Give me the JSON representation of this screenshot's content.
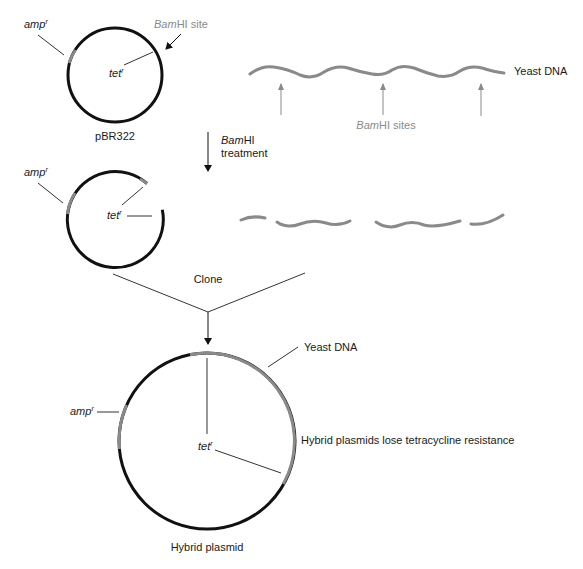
{
  "diagram": {
    "colors": {
      "plasmid_dna": "#111111",
      "yeast_dna": "#8a8a8a",
      "annotation_line": "#333333",
      "site_label": "#8a8a8a"
    },
    "step1": {
      "plasmid": {
        "name": "pBR322",
        "amp_label": "amp",
        "amp_sup": "r",
        "tet_label": "tet",
        "tet_sup": "r",
        "site_label_italic": "Bam",
        "site_label_rest": "HI site"
      },
      "yeast": {
        "label": "Yeast DNA",
        "sites_label_italic": "Bam",
        "sites_label_rest": "HI sites",
        "site_count": 3
      }
    },
    "step2": {
      "arrow_label_italic": "Bam",
      "arrow_label_rest": "HI",
      "arrow_label_line2": "treatment",
      "cut_plasmid": {
        "amp_label": "amp",
        "amp_sup": "r",
        "tet_label": "tet",
        "tet_sup": "r"
      },
      "yeast_fragments": 4
    },
    "step3": {
      "label": "Clone"
    },
    "result": {
      "name": "Hybrid plasmid",
      "yeast_label": "Yeast DNA",
      "amp_label": "amp",
      "amp_sup": "r",
      "tet_label": "tet",
      "tet_sup": "r",
      "note": "Hybrid plasmids lose tetracycline resistance"
    }
  }
}
